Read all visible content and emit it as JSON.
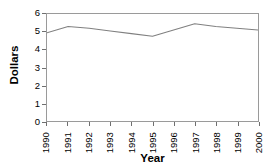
{
  "chart_data": {
    "type": "line",
    "title": "",
    "xlabel": "Year",
    "ylabel": "Dollars",
    "x": [
      1990,
      1991,
      1992,
      1993,
      1994,
      1995,
      1996,
      1997,
      1998,
      1999,
      2000
    ],
    "categories": [
      "1990",
      "1991",
      "1992",
      "1993",
      "1994",
      "1995",
      "1996",
      "1997",
      "1998",
      "1999",
      "2000"
    ],
    "values": [
      4.95,
      5.3,
      5.2,
      5.05,
      4.9,
      4.75,
      5.1,
      5.45,
      5.3,
      5.2,
      5.1
    ],
    "series": [
      {
        "name": "Dollars",
        "values": [
          4.95,
          5.3,
          5.2,
          5.05,
          4.9,
          4.75,
          5.1,
          5.45,
          5.3,
          5.2,
          5.1
        ]
      }
    ],
    "ylim": [
      0,
      6
    ],
    "yticks": [
      0,
      1,
      2,
      3,
      4,
      5,
      6
    ],
    "ytick_labels": [
      "0",
      "1",
      "2",
      "3",
      "4",
      "5",
      "6"
    ],
    "xlim": [
      1990,
      2000
    ],
    "grid": false,
    "legend": false,
    "legend_position": "none",
    "line_color": "#808080",
    "frame_color": "#9a9a9a",
    "background_color": "#ffffff",
    "xtick_rotation": 90
  }
}
